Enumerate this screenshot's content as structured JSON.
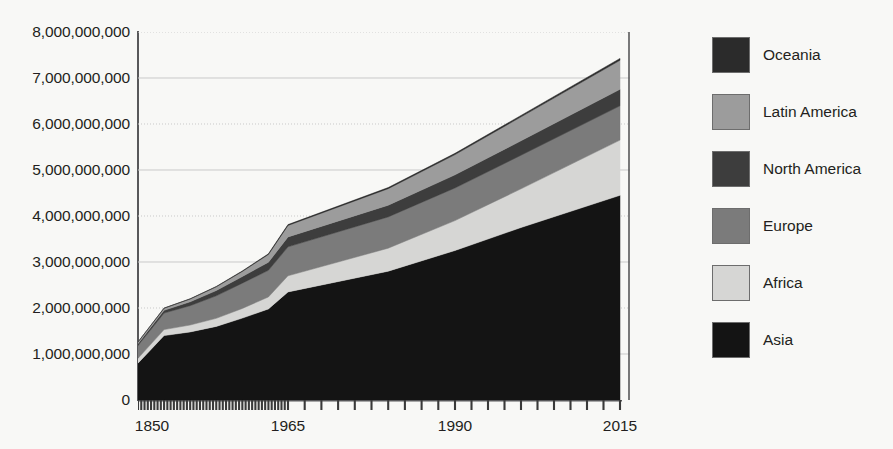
{
  "chart_data": {
    "type": "area",
    "title": "",
    "subtitle": "",
    "xlabel": "",
    "ylabel": "",
    "stacked": true,
    "grid": true,
    "legend_position": "right",
    "xlim": [
      1850,
      2015
    ],
    "ylim": [
      0,
      8000000000
    ],
    "x_tick_labels": [
      "1850",
      "1965",
      "1990",
      "2015"
    ],
    "x_tick_values": [
      1850,
      1965,
      1990,
      2015
    ],
    "y_tick_labels": [
      "8,000,000,000",
      "7,000,000,000",
      "6,000,000,000",
      "5,000,000,000",
      "4,000,000,000",
      "3,000,000,000",
      "2,000,000,000",
      "1,000,000,000",
      "0"
    ],
    "y_tick_values": [
      8000000000,
      7000000000,
      6000000000,
      5000000000,
      4000000000,
      3000000000,
      2000000000,
      1000000000,
      0
    ],
    "x": [
      1850,
      1870,
      1890,
      1910,
      1930,
      1950,
      1965,
      1980,
      1990,
      2000,
      2015
    ],
    "series": [
      {
        "name": "Asia",
        "color": "#141414",
        "values": [
          800000000,
          1400000000,
          1480000000,
          1600000000,
          1780000000,
          1980000000,
          2350000000,
          2800000000,
          3250000000,
          3750000000,
          4450000000
        ]
      },
      {
        "name": "Africa",
        "color": "#d6d6d4",
        "values": [
          105000000,
          130000000,
          150000000,
          175000000,
          210000000,
          260000000,
          350000000,
          500000000,
          650000000,
          840000000,
          1200000000
        ]
      },
      {
        "name": "Europe",
        "color": "#7b7b7b",
        "values": [
          280000000,
          360000000,
          420000000,
          490000000,
          550000000,
          580000000,
          630000000,
          680000000,
          710000000,
          730000000,
          745000000
        ]
      },
      {
        "name": "North America",
        "color": "#3d3d3d",
        "values": [
          40000000,
          60000000,
          85000000,
          115000000,
          145000000,
          175000000,
          215000000,
          255000000,
          285000000,
          315000000,
          360000000
        ]
      },
      {
        "name": "Latin America",
        "color": "#9c9c9c",
        "values": [
          35000000,
          45000000,
          60000000,
          80000000,
          110000000,
          170000000,
          250000000,
          360000000,
          440000000,
          520000000,
          630000000
        ]
      },
      {
        "name": "Oceania",
        "color": "#2b2b2b",
        "values": [
          2000000,
          4000000,
          6000000,
          8000000,
          11000000,
          13000000,
          18000000,
          23000000,
          27000000,
          31000000,
          40000000
        ]
      }
    ],
    "stack_order_bottom_to_top": [
      "Asia",
      "Africa",
      "Europe",
      "North America",
      "Latin America",
      "Oceania"
    ],
    "totals": [
      1262000000,
      1999000000,
      2201000000,
      2468000000,
      2806000000,
      3178000000,
      3813000000,
      4618000000,
      5362000000,
      6186000000,
      7425000000
    ]
  },
  "legend": {
    "items": [
      {
        "label": "Oceania",
        "color": "#2b2b2b"
      },
      {
        "label": "Latin America",
        "color": "#9c9c9c"
      },
      {
        "label": "North America",
        "color": "#3d3d3d"
      },
      {
        "label": "Europe",
        "color": "#7b7b7b"
      },
      {
        "label": "Africa",
        "color": "#d6d6d4"
      },
      {
        "label": "Asia",
        "color": "#141414"
      }
    ]
  },
  "colors": {
    "background": "#f8f8f6",
    "axis": "#58585a",
    "gridline": "#c9c9c9",
    "text": "#231f20"
  }
}
